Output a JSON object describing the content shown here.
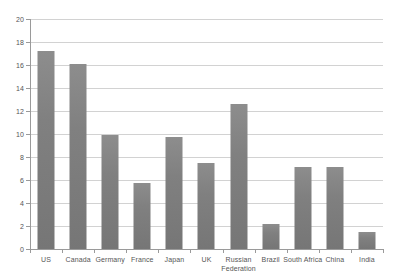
{
  "chart_data": {
    "type": "bar",
    "title": "",
    "xlabel": "",
    "ylabel": "",
    "ylim": [
      0,
      20
    ],
    "ytick_step": 2,
    "yticks": [
      "20",
      "18",
      "16",
      "14",
      "12",
      "10",
      "8",
      "6",
      "4",
      "2",
      "0"
    ],
    "grid": true,
    "legend": "none",
    "bar_color": "#808080",
    "gridline_color": "#d2d2d2",
    "axis_color": "#9a9a9a",
    "categories": [
      "US",
      "Canada",
      "Germany",
      "France",
      "Japan",
      "UK",
      "Russian Federation",
      "Brazil",
      "South Africa",
      "China",
      "India"
    ],
    "values": [
      17.2,
      16.1,
      9.9,
      5.7,
      9.7,
      7.5,
      12.6,
      2.2,
      7.1,
      7.1,
      1.5
    ]
  }
}
